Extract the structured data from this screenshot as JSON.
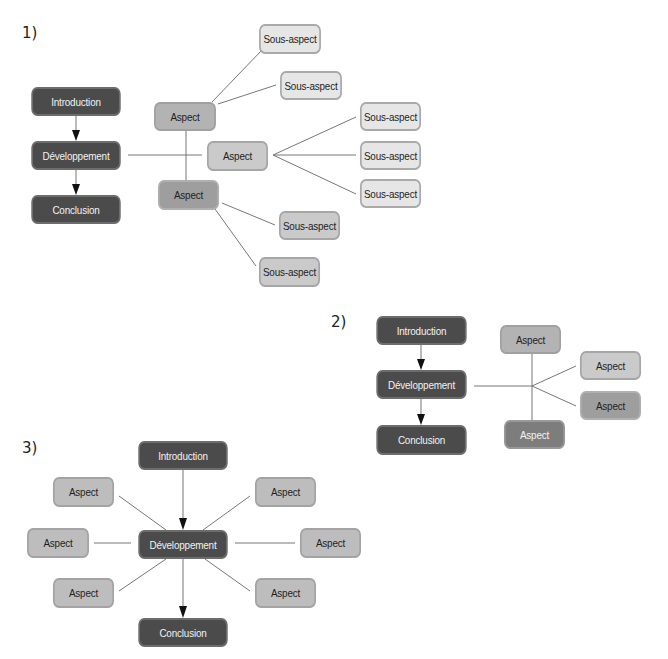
{
  "colors": {
    "dark_box": "#4b4b4b",
    "dark_gray_box": "#7d7d7d",
    "medium_gray_box": "#9e9e9e",
    "gray_box": "#b3b3b3",
    "light_gray_box": "#cacaca",
    "lightest_box": "#e6e6e6",
    "connector": "#777777",
    "arrow": "#111111"
  },
  "diagram1": {
    "label": "1)",
    "spine": {
      "introduction": "Introduction",
      "developpement": "Développement",
      "conclusion": "Conclusion"
    },
    "aspects": [
      {
        "label": "Aspect",
        "sub_aspects": [
          "Sous-aspect",
          "Sous-aspect"
        ]
      },
      {
        "label": "Aspect",
        "sub_aspects": [
          "Sous-aspect",
          "Sous-aspect",
          "Sous-aspect"
        ]
      },
      {
        "label": "Aspect",
        "sub_aspects": [
          "Sous-aspect",
          "Sous-aspect"
        ]
      }
    ]
  },
  "diagram2": {
    "label": "2)",
    "spine": {
      "introduction": "Introduction",
      "developpement": "Développement",
      "conclusion": "Conclusion"
    },
    "aspects": [
      "Aspect",
      "Aspect",
      "Aspect",
      "Aspect"
    ]
  },
  "diagram3": {
    "label": "3)",
    "spine": {
      "introduction": "Introduction",
      "developpement": "Développement",
      "conclusion": "Conclusion"
    },
    "aspects": [
      "Aspect",
      "Aspect",
      "Aspect",
      "Aspect",
      "Aspect",
      "Aspect"
    ]
  }
}
